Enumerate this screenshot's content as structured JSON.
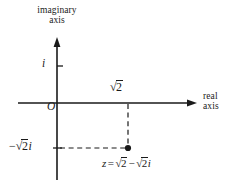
{
  "figure": {
    "type": "complex-plane-argand-diagram",
    "background_color": "#ffffff",
    "ink_color": "#1a1a1a"
  },
  "axes": {
    "vertical": {
      "name": "imaginary-axis",
      "label_line1": "imaginary",
      "label_line2": "axis",
      "x_px": 57,
      "top_px": 38,
      "bottom_px": 180,
      "arrow": "up"
    },
    "horizontal": {
      "name": "real-axis",
      "label_line1": "real",
      "label_line2": "axis",
      "y_px": 103,
      "left_px": 18,
      "right_px": 197,
      "arrow": "right"
    }
  },
  "origin": {
    "label": "O",
    "x_px": 57,
    "y_px": 103
  },
  "ticks": [
    {
      "name": "tick-i",
      "axis": "imaginary",
      "value": 1,
      "label_sign": "",
      "label_radicand": "",
      "label_plain": "i",
      "y_px": 66
    },
    {
      "name": "tick-neg-sqrt2i",
      "axis": "imaginary",
      "value": -1.41421356,
      "label_sign": "−",
      "label_glyph": "√",
      "label_radicand": "2",
      "label_unit": "i",
      "y_px": 148
    },
    {
      "name": "tick-sqrt2",
      "axis": "real",
      "value": 1.41421356,
      "label_glyph": "√",
      "label_radicand": "2",
      "x_px": 128
    }
  ],
  "point": {
    "name": "plotted-point-z",
    "x_px": 128,
    "y_px": 148,
    "real_part": 1.41421356,
    "imag_part": -1.41421356,
    "equation": {
      "variable": "z",
      "equals": "=",
      "real_glyph": "√",
      "real_radicand": "2",
      "operator": "−",
      "imag_glyph": "√",
      "imag_radicand": "2",
      "imag_unit": "i",
      "plain": "z = √2 − √2i"
    }
  },
  "guides": [
    {
      "name": "vertical-dashed-guide",
      "from_x": 128,
      "from_y": 103,
      "to_x": 128,
      "to_y": 148,
      "style": "dashed"
    },
    {
      "name": "horizontal-dashed-guide",
      "from_x": 57,
      "from_y": 148,
      "to_x": 128,
      "to_y": 148,
      "style": "dashed"
    }
  ]
}
